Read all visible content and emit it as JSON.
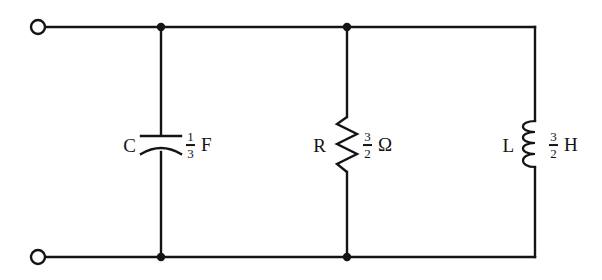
{
  "figure": {
    "name": "parallel-rlc-circuit",
    "background_color": "#ffffff",
    "ink_color": "#141414",
    "width": 602,
    "height": 280
  },
  "components": {
    "capacitor": {
      "symbol_label": "C",
      "numerator": "1",
      "denominator": "3",
      "unit": "F",
      "symbol_type": "capacitor-curved-plate",
      "branch_x": 161,
      "label_y": 145
    },
    "resistor": {
      "symbol_label": "R",
      "numerator": "3",
      "denominator": "2",
      "unit": "Ω",
      "symbol_type": "resistor-zigzag",
      "branch_x": 347,
      "label_y": 145
    },
    "inductor": {
      "symbol_label": "L",
      "numerator": "3",
      "denominator": "2",
      "unit": "H",
      "symbol_type": "inductor-coil",
      "branch_x": 535,
      "label_y": 145
    }
  },
  "terminals": {
    "top": {
      "name": "top-terminal",
      "cx": 38,
      "cy": 27,
      "r": 7
    },
    "bottom": {
      "name": "bottom-terminal",
      "cx": 38,
      "cy": 257,
      "r": 7
    }
  },
  "rails": {
    "top_y": 27,
    "bottom_y": 257,
    "left_x": 45,
    "right_x": 535
  },
  "junction_dots": [
    {
      "name": "junction-top-capacitor",
      "cx": 161,
      "cy": 27
    },
    {
      "name": "junction-top-resistor",
      "cx": 347,
      "cy": 27
    },
    {
      "name": "junction-bottom-capacitor",
      "cx": 161,
      "cy": 257
    },
    {
      "name": "junction-bottom-resistor",
      "cx": 347,
      "cy": 257
    }
  ]
}
